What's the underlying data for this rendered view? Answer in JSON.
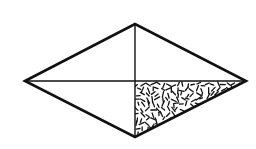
{
  "diagram": {
    "type": "rhombus-with-diagonals",
    "vertices": {
      "left": [
        25,
        81
      ],
      "top": [
        135,
        24
      ],
      "right": [
        246,
        81
      ],
      "bottom": [
        135,
        137
      ]
    },
    "center": [
      135,
      81
    ],
    "stroke_color": "#111111",
    "outline_width": 2.6,
    "diagonal_width": 1.4,
    "shaded_region": "bottom-right-triangle",
    "shade_pattern": "random-dashes",
    "shade_color": "#111111"
  }
}
